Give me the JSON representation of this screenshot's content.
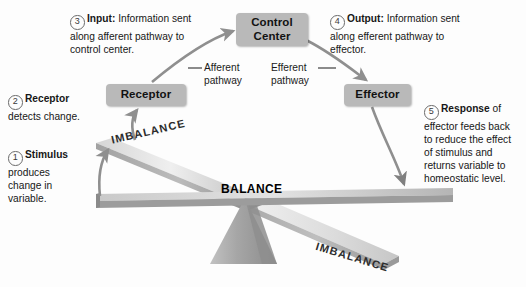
{
  "diagram": {
    "nodes": {
      "control_center": "Control Center",
      "receptor": "Receptor",
      "effector": "Effector"
    },
    "pathways": {
      "afferent": "Afferent pathway",
      "afferent_line1": "Afferent",
      "afferent_line2": "pathway",
      "efferent": "Efferent pathway",
      "efferent_line1": "Efferent",
      "efferent_line2": "pathway"
    },
    "states": {
      "balance": "BALANCE",
      "imbalance_upper": "IMBALANCE",
      "imbalance_lower": "IMBALANCE"
    },
    "steps": [
      {
        "number": "1",
        "lead": "Stimulus",
        "body": "produces change in variable.",
        "full": "Stimulus produces change in variable."
      },
      {
        "number": "2",
        "lead": "Receptor",
        "body": "detects change.",
        "full": "Receptor detects change."
      },
      {
        "number": "3",
        "lead": "Input:",
        "body": "Information sent along afferent pathway to control center.",
        "full": "Input: Information sent along afferent pathway to control center."
      },
      {
        "number": "4",
        "lead": "Output:",
        "body": "Information sent along efferent pathway to effector.",
        "full": "Output: Information sent along efferent pathway to effector."
      },
      {
        "number": "5",
        "lead": "Response",
        "body": "of effector feeds back to reduce the effect of stimulus and returns variable to homeostatic level.",
        "full": "Response of effector feeds back to reduce the effect of stimulus and returns variable to homeostatic level."
      }
    ],
    "colors": {
      "node_fill": "#b9b9b9",
      "arrow": "#8f8f8f",
      "beam_light": "#e6e6e6",
      "beam_mid": "#c4c4c4",
      "beam_dark": "#9a9a9a",
      "fulcrum": "#a9a9a9",
      "text": "#171717",
      "background": "#fdfdfd"
    }
  }
}
